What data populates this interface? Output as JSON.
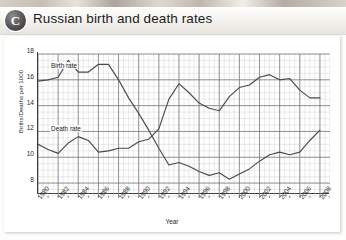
{
  "header": {
    "badge": "C",
    "title": "Russian birth and death rates"
  },
  "chart_data": {
    "type": "line",
    "title": "Russian birth and death rates",
    "xlabel": "Year",
    "ylabel": "Births/Deaths per 1000",
    "xlim": [
      1980,
      2009
    ],
    "ylim": [
      7,
      18
    ],
    "yticks": [
      18,
      16,
      14,
      12,
      10,
      8
    ],
    "xticks": [
      1980,
      1982,
      1984,
      1986,
      1988,
      1990,
      1992,
      1994,
      1996,
      1998,
      2000,
      2002,
      2004,
      2006,
      2008
    ],
    "grid": true,
    "legend": "inline-labels",
    "x": [
      1980,
      1981,
      1982,
      1983,
      1984,
      1985,
      1986,
      1987,
      1988,
      1989,
      1990,
      1991,
      1992,
      1993,
      1994,
      1995,
      1996,
      1997,
      1998,
      1999,
      2000,
      2001,
      2002,
      2003,
      2004,
      2005,
      2006,
      2007,
      2008
    ],
    "series": [
      {
        "name": "Birth rate",
        "label": "Birth rate",
        "color": "#4a4a4a",
        "values": [
          15.9,
          16.0,
          16.2,
          17.5,
          16.6,
          16.6,
          17.2,
          17.2,
          16.0,
          14.6,
          13.4,
          12.1,
          10.7,
          9.4,
          9.6,
          9.3,
          8.9,
          8.6,
          8.8,
          8.3,
          8.7,
          9.1,
          9.7,
          10.2,
          10.4,
          10.2,
          10.4,
          11.3,
          12.1
        ]
      },
      {
        "name": "Death rate",
        "label": "Death rate",
        "color": "#4a4a4a",
        "values": [
          11.0,
          10.6,
          10.3,
          11.1,
          11.6,
          11.3,
          10.4,
          10.5,
          10.7,
          10.7,
          11.2,
          11.4,
          12.2,
          14.5,
          15.7,
          15.0,
          14.2,
          13.8,
          13.6,
          14.7,
          15.4,
          15.6,
          16.2,
          16.4,
          16.0,
          16.1,
          15.2,
          14.6,
          14.6
        ]
      }
    ],
    "annotations": [
      {
        "text": "Birth rate",
        "x": 1981,
        "y": 16.9
      },
      {
        "text": "Death rate",
        "x": 1981,
        "y": 12.0
      }
    ]
  }
}
